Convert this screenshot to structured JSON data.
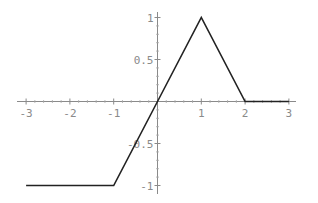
{
  "chart_data": {
    "type": "line",
    "title": "",
    "xlabel": "",
    "ylabel": "",
    "xlim": [
      -3,
      3
    ],
    "ylim": [
      -1,
      1
    ],
    "grid": false,
    "legend": null,
    "x_ticks": [
      -3,
      -2,
      -1,
      1,
      2,
      3
    ],
    "x_tick_labels": [
      "-3",
      "-2",
      "-1",
      "1",
      "2",
      "3"
    ],
    "y_ticks": [
      1,
      0.5,
      -0.5,
      -1
    ],
    "y_tick_labels": [
      "1",
      "0.5",
      "-0.5",
      "-1"
    ],
    "series": [
      {
        "name": "f(x)",
        "color": "#222222",
        "x": [
          -3,
          -1,
          0,
          1,
          2,
          3
        ],
        "y": [
          -1,
          -1,
          0,
          1,
          0,
          0
        ]
      }
    ]
  },
  "style": {
    "axis_color": "#8a8a8a",
    "line_color": "#222222",
    "background": "#ffffff"
  }
}
